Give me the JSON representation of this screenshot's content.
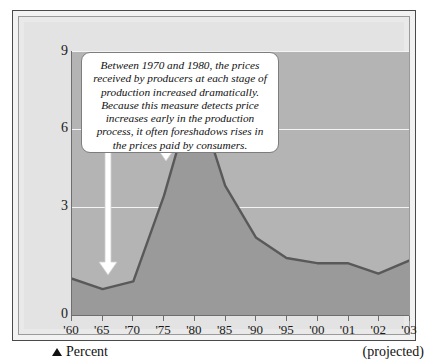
{
  "figure": {
    "callout_text": "Between 1970 and 1980, the prices received by producers at each stage of production increased dramatically. Because this measure detects price increases early in the production process, it often foreshadows rises in the prices paid by consumers.",
    "legend_label": "Percent",
    "legend_icon": "triangle-up-icon",
    "projected_note": "(projected)"
  },
  "chart_data": {
    "type": "area",
    "title": "",
    "subtitle": "",
    "xlabel": "",
    "ylabel": "Percent",
    "categories": [
      "'60",
      "'65",
      "'70",
      "'75",
      "'80",
      "'85",
      "'90",
      "'95",
      "'00",
      "'01",
      "'02",
      "'03"
    ],
    "x_tick_labels": [
      "'60",
      "'65",
      "'70",
      "'75",
      "'80",
      "'85",
      "'90",
      "'95",
      "'00",
      "'01",
      "'02",
      "'03"
    ],
    "y_tick_labels": [
      "0",
      "3",
      "6",
      "9"
    ],
    "y_ticks": [
      0,
      3,
      6,
      9
    ],
    "ylim": [
      0,
      10.2
    ],
    "grid": "horizontal",
    "legend": "none",
    "values": [
      1.4,
      1.0,
      1.3,
      4.6,
      8.7,
      5.0,
      3.0,
      2.2,
      2.0,
      2.0,
      1.6,
      2.1
    ],
    "series": [
      {
        "name": "Producer price change",
        "values": [
          1.4,
          1.0,
          1.3,
          4.6,
          8.7,
          5.0,
          3.0,
          2.2,
          2.0,
          2.0,
          1.6,
          2.1
        ]
      }
    ],
    "annotations": [
      {
        "name": "callout-arrow-1970",
        "text": "arrow pointing to 1970",
        "x": "'70",
        "y": 1.3
      },
      {
        "name": "callout-arrow-1980",
        "text": "arrow pointing to 1980 peak",
        "x": "'80",
        "y": 8.7
      }
    ],
    "colors": {
      "plot_background": "#b4b4b4",
      "area_fill": "#9a9a9a",
      "line": "#595959",
      "gridline": "#f4f4f4",
      "axis": "#6e6e6e",
      "callout_background": "#ffffff",
      "arrow": "#ffffff",
      "text": "#111111"
    }
  }
}
